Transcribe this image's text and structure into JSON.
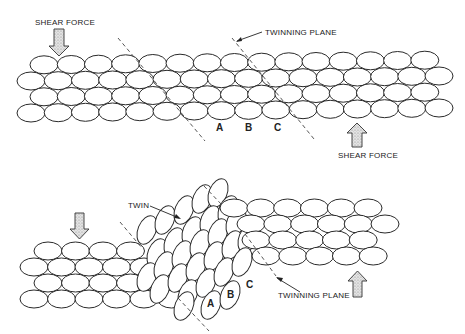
{
  "diagram": {
    "top_panel": {
      "name": "before-twinning",
      "labels": {
        "shear_force_top": "SHEAR FORCE",
        "shear_force_bottom": "SHEAR FORCE",
        "twinning_plane": "TWINNING PLANE",
        "plane_a": "A",
        "plane_b": "B",
        "plane_c": "C"
      }
    },
    "bottom_panel": {
      "name": "after-twinning",
      "labels": {
        "twin": "TWIN",
        "twinning_plane": "TWINNING PLANE",
        "plane_a": "A",
        "plane_b": "B",
        "plane_c": "C"
      }
    },
    "colors": {
      "line": "#2a2a2a",
      "background": "#ffffff",
      "arrow_fill": "#cccccc"
    }
  }
}
